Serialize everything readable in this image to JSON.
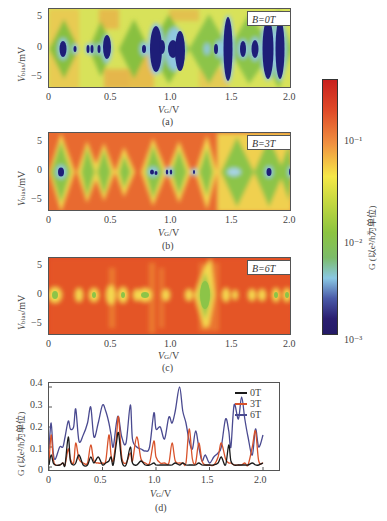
{
  "panels": [
    {
      "id": "a",
      "label": "B=0T",
      "caption": "(a)",
      "xlabel": "V_G/V",
      "ylabel": "V_bias/mV",
      "xticks": [
        "0",
        "0.5",
        "1.0",
        "1.5",
        "2.0"
      ],
      "yticks": [
        "5",
        "0",
        "−5"
      ]
    },
    {
      "id": "b",
      "label": "B=3T",
      "caption": "(b)",
      "xlabel": "V_G/V",
      "ylabel": "V_bias/mV",
      "xticks": [
        "0",
        "0.5",
        "1.0",
        "1.5",
        "2.0"
      ],
      "yticks": [
        "5",
        "0",
        "−5"
      ]
    },
    {
      "id": "c",
      "label": "B=6T",
      "caption": "(c)",
      "xlabel": "V_G/V",
      "ylabel": "V_bias/mV",
      "xticks": [
        "0",
        "0.5",
        "1.0",
        "1.5",
        "2.0"
      ],
      "yticks": [
        "5",
        "0",
        "−5"
      ]
    }
  ],
  "colorbar": {
    "label": "G (以e²/h为单位)",
    "ticks": [
      "10⁻¹",
      "10⁻²",
      "10⁻³"
    ],
    "scale": "log",
    "range": [
      0.001,
      0.3
    ],
    "colors": [
      "#c8201e",
      "#e8502a",
      "#f0a040",
      "#f4e840",
      "#b8d040",
      "#7cc040",
      "#6ab880",
      "#90c8e0",
      "#3a4aa0",
      "#241a6a"
    ]
  },
  "line_chart": {
    "caption": "(d)",
    "xlabel": "V_G/V",
    "ylabel": "G (以e²/h为单位)",
    "xticks": [
      "0",
      "0.5",
      "1.0",
      "1.5",
      "2.0"
    ],
    "yticks": [
      "0.4",
      "0.3",
      "0.2",
      "0.1",
      "0"
    ],
    "legend": [
      {
        "name": "0T",
        "color": "#1a1a1a"
      },
      {
        "name": "3T",
        "color": "#d8522a"
      },
      {
        "name": "6T",
        "color": "#4a4a90"
      }
    ]
  },
  "chart_data": [
    {
      "type": "heatmap",
      "title": "B=0T",
      "xlabel": "V_G/V",
      "ylabel": "V_bias/mV",
      "xlim": [
        0,
        2.0
      ],
      "ylim": [
        -6.5,
        6.5
      ],
      "colorscale": "log conductance G (e²/h), 10⁻³ to ~0.3",
      "coulomb_diamonds_centers_VG": [
        0.12,
        0.22,
        0.33,
        0.36,
        0.42,
        0.49,
        0.8,
        0.9,
        0.96,
        1.05,
        1.1,
        1.3,
        1.38,
        1.43,
        1.5,
        1.62,
        1.72,
        1.82,
        1.92
      ],
      "notes": "Dark blue (low G ~10⁻³) diamonds centered at V_bias=0; background green/yellow with orange at edges"
    },
    {
      "type": "heatmap",
      "title": "B=3T",
      "xlabel": "V_G/V",
      "ylabel": "V_bias/mV",
      "xlim": [
        0,
        2.0
      ],
      "ylim": [
        -6.5,
        6.5
      ],
      "coulomb_diamonds_centers_VG": [
        0.1,
        0.32,
        0.45,
        0.58,
        0.72,
        0.9,
        0.95,
        1.07,
        1.1,
        1.4,
        1.62,
        1.8,
        1.88,
        1.98
      ],
      "notes": "Mostly orange/red background with green diamonds; small blue cores near 0.1, 0.9, 1.88 V"
    },
    {
      "type": "heatmap",
      "title": "B=6T",
      "xlabel": "V_G/V",
      "ylabel": "V_bias/mV",
      "xlim": [
        0,
        2.0
      ],
      "ylim": [
        -6.5,
        6.5
      ],
      "coulomb_diamonds_centers_VG": [
        0.06,
        0.28,
        0.42,
        0.58,
        0.68,
        0.82,
        0.88,
        0.9,
        1.08,
        1.32,
        1.42,
        1.47,
        1.65,
        1.9,
        1.98
      ],
      "notes": "Red/orange background; small yellow-green spots on V_bias=0 line; largest diamond near 1.45 V"
    },
    {
      "type": "line",
      "title": "",
      "xlabel": "V_G/V",
      "ylabel": "G (以e²/h为单位)",
      "xlim": [
        0,
        2.0
      ],
      "ylim": [
        0,
        0.42
      ],
      "legend_position": "upper right",
      "x": [
        0,
        0.02,
        0.04,
        0.06,
        0.1,
        0.13,
        0.15,
        0.18,
        0.2,
        0.23,
        0.25,
        0.28,
        0.32,
        0.36,
        0.39,
        0.42,
        0.46,
        0.5,
        0.53,
        0.56,
        0.58,
        0.6,
        0.63,
        0.65,
        0.68,
        0.72,
        0.76,
        0.78,
        0.82,
        0.86,
        0.9,
        0.94,
        0.98,
        1.0,
        1.04,
        1.08,
        1.12,
        1.15,
        1.18,
        1.22,
        1.25,
        1.28,
        1.31,
        1.34,
        1.37,
        1.4,
        1.43,
        1.46,
        1.5,
        1.54,
        1.58,
        1.61,
        1.65,
        1.68,
        1.7,
        1.73,
        1.77,
        1.8,
        1.83,
        1.86,
        1.9,
        1.93,
        1.96,
        2.0
      ],
      "series": [
        {
          "name": "0T",
          "values": [
            0.01,
            0.06,
            0.02,
            0.01,
            0.01,
            0.02,
            0.01,
            0.15,
            0.03,
            0.01,
            0.02,
            0.06,
            0.01,
            0.01,
            0.05,
            0.02,
            0.05,
            0.01,
            0.02,
            0.03,
            0.05,
            0.01,
            0.12,
            0.17,
            0.03,
            0.01,
            0.1,
            0.02,
            0.01,
            0.03,
            0.01,
            0.01,
            0.02,
            0.01,
            0.01,
            0.01,
            0.01,
            0.01,
            0.02,
            0.01,
            0.02,
            0.01,
            0.01,
            0.01,
            0.01,
            0.02,
            0.01,
            0.01,
            0.01,
            0.01,
            0.02,
            0.05,
            0.01,
            0.11,
            0.03,
            0.01,
            0.01,
            0.01,
            0.01,
            0.01,
            0.02,
            0.01,
            0.01,
            0.02
          ]
        },
        {
          "name": "3T",
          "values": [
            0.02,
            0.16,
            0.04,
            0.01,
            0.01,
            0.02,
            0.01,
            0.09,
            0.04,
            0.02,
            0.12,
            0.04,
            0.02,
            0.02,
            0.11,
            0.03,
            0.02,
            0.02,
            0.03,
            0.16,
            0.06,
            0.03,
            0.15,
            0.25,
            0.05,
            0.02,
            0.07,
            0.03,
            0.15,
            0.04,
            0.02,
            0.02,
            0.13,
            0.05,
            0.02,
            0.02,
            0.02,
            0.12,
            0.03,
            0.02,
            0.02,
            0.02,
            0.19,
            0.04,
            0.02,
            0.12,
            0.03,
            0.01,
            0.01,
            0.01,
            0.05,
            0.12,
            0.04,
            0.02,
            0.02,
            0.01,
            0.01,
            0.01,
            0.02,
            0.01,
            0.1,
            0.18,
            0.03,
            0.02
          ]
        },
        {
          "name": "6T",
          "values": [
            0.09,
            0.22,
            0.07,
            0.04,
            0.1,
            0.1,
            0.15,
            0.23,
            0.19,
            0.2,
            0.29,
            0.13,
            0.16,
            0.22,
            0.3,
            0.15,
            0.22,
            0.31,
            0.28,
            0.22,
            0.16,
            0.1,
            0.22,
            0.25,
            0.15,
            0.12,
            0.31,
            0.14,
            0.1,
            0.09,
            0.08,
            0.1,
            0.27,
            0.19,
            0.2,
            0.14,
            0.25,
            0.22,
            0.28,
            0.4,
            0.28,
            0.22,
            0.13,
            0.09,
            0.18,
            0.1,
            0.03,
            0.06,
            0.02,
            0.05,
            0.07,
            0.1,
            0.24,
            0.18,
            0.1,
            0.31,
            0.24,
            0.35,
            0.24,
            0.15,
            0.06,
            0.19,
            0.1,
            0.16
          ]
        }
      ]
    }
  ]
}
